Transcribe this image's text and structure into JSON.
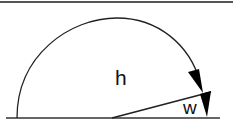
{
  "diagram": {
    "labels": {
      "h": "h",
      "w": "w"
    },
    "elements": [
      {
        "type": "line",
        "name": "top-border",
        "color": "#555555"
      },
      {
        "type": "line",
        "name": "baseline",
        "color": "#333333"
      },
      {
        "type": "arc",
        "name": "semicircle-arc-h",
        "color": "#222222"
      },
      {
        "type": "arrow",
        "name": "arrowhead-h",
        "color": "#000000"
      },
      {
        "type": "line",
        "name": "inclined-line",
        "color": "#222222"
      },
      {
        "type": "arrow",
        "name": "arrowhead-w",
        "color": "#000000"
      }
    ],
    "colors": {
      "stroke": "#222222",
      "fill": "#000000",
      "background": "#ffffff"
    }
  }
}
